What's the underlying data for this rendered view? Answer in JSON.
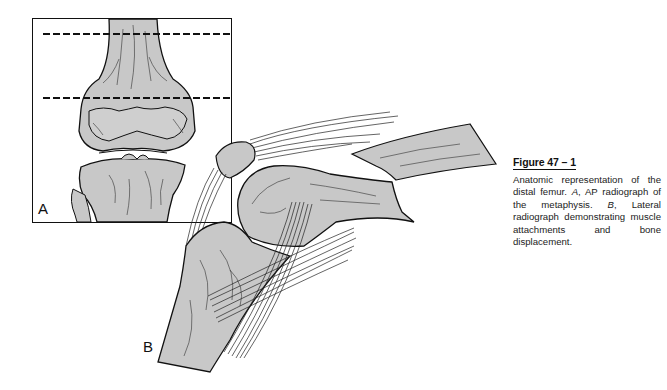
{
  "figure": {
    "panel_a_label": "A",
    "panel_b_label": "B",
    "panel_a_description": "AP view of distal femur and proximal tibia with two dashed lines marking the metaphysis",
    "panel_b_description": "Lateral view of knee showing displaced distal femoral fracture with muscle and tendon attachments"
  },
  "caption": {
    "title": "Figure 47 – 1",
    "text_1": "Anatomic representation of the distal femur. ",
    "a_ref": "A",
    "text_2": ", AP radiograph of the metaphysis. ",
    "b_ref": "B",
    "text_3": ", Lateral radiograph demonstrating muscle attachments and bone displacement."
  },
  "colors": {
    "bone_fill": "#c8c8c8",
    "ink": "#111111",
    "background": "#ffffff"
  }
}
